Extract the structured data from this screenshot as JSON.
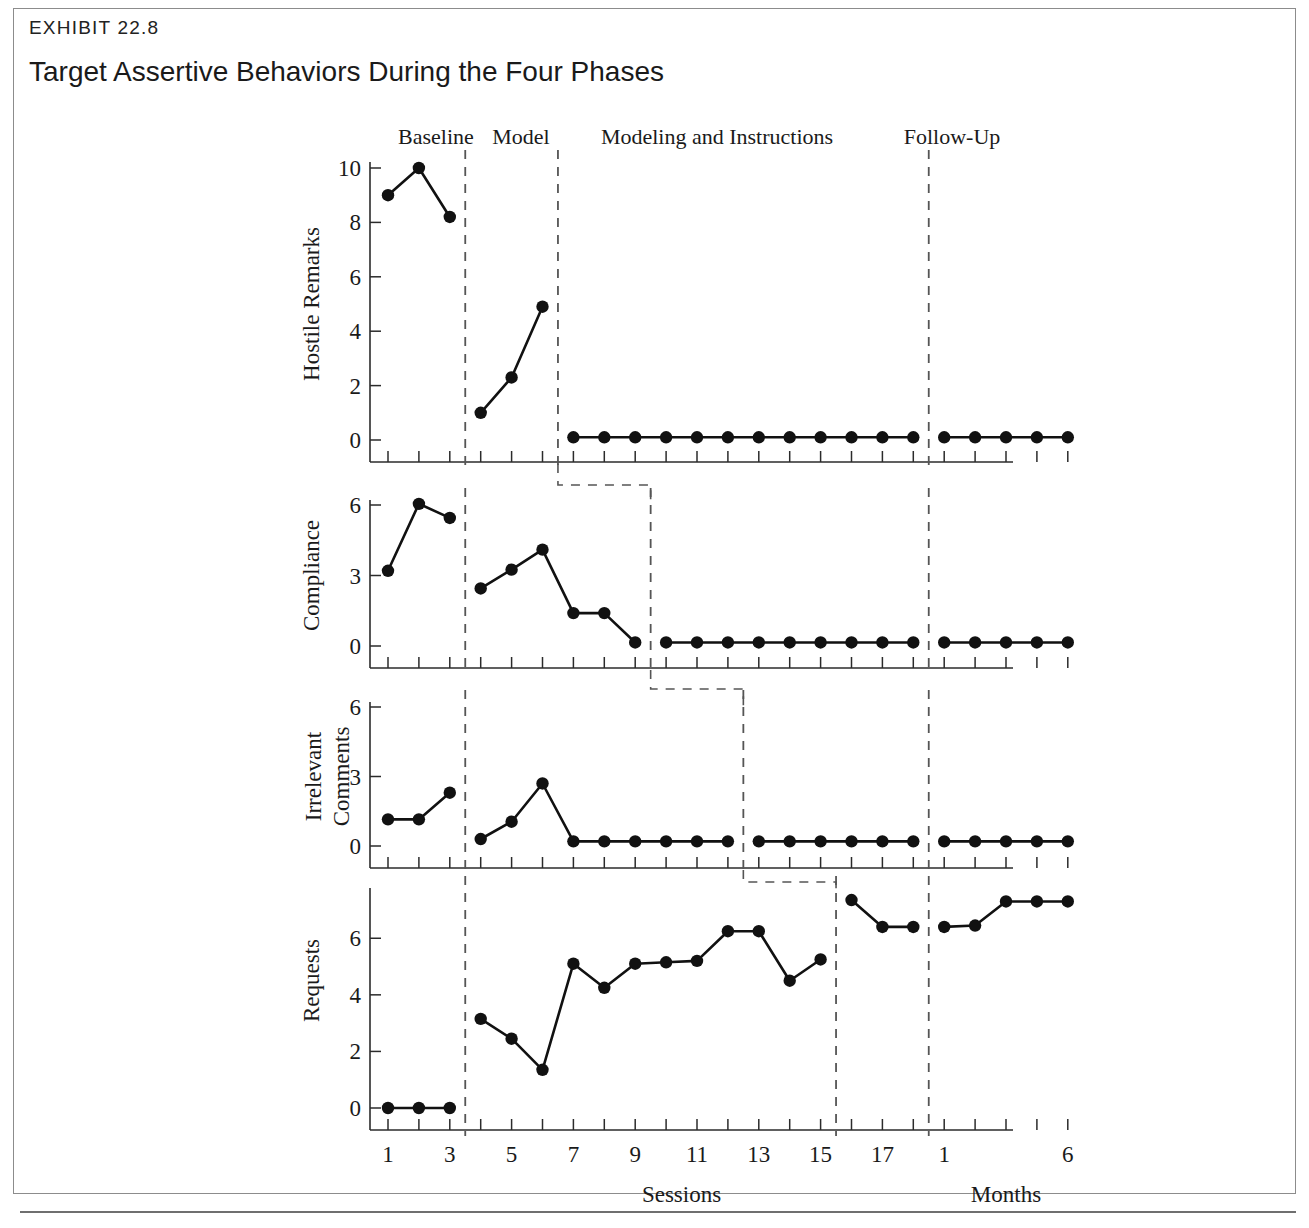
{
  "exhibit": {
    "kicker": "EXHIBIT 22.8",
    "title": "Target Assertive Behaviors During the Four Phases"
  },
  "chart_data": {
    "type": "line",
    "title": "Target Assertive Behaviors During the Four Phases",
    "xlabel": "Sessions",
    "xlabel_secondary": "Months",
    "grid": false,
    "legend": "none",
    "phases": [
      {
        "name": "Baseline",
        "sessions": [
          1,
          3
        ]
      },
      {
        "name": "Model",
        "sessions": [
          4,
          6
        ]
      },
      {
        "name": "Modeling and Instructions",
        "sessions": [
          7,
          18
        ]
      },
      {
        "name": "Follow-Up",
        "months": [
          1,
          6
        ]
      }
    ],
    "x_tick_labels_sessions": [
      "1",
      "3",
      "5",
      "7",
      "9",
      "11",
      "13",
      "15",
      "17"
    ],
    "x_tick_labels_months": [
      "1",
      "6"
    ],
    "panels": [
      {
        "ylabel": "Hostile Remarks",
        "ylim": [
          0,
          10
        ],
        "yticks": [
          0,
          2,
          4,
          6,
          8,
          10
        ],
        "segments": [
          {
            "phase": "Baseline",
            "x": [
              1,
              2,
              3
            ],
            "y": [
              9.0,
              10.0,
              8.2
            ]
          },
          {
            "phase": "Model",
            "x": [
              4,
              5,
              6
            ],
            "y": [
              1.0,
              2.3,
              4.9
            ]
          },
          {
            "phase": "Modeling and Instructions",
            "x": [
              7,
              8,
              9,
              10,
              11,
              12,
              13,
              14,
              15,
              16,
              17,
              18
            ],
            "y": [
              0.1,
              0.1,
              0.1,
              0.1,
              0.1,
              0.1,
              0.1,
              0.1,
              0.1,
              0.1,
              0.1,
              0.1
            ]
          },
          {
            "phase": "Follow-Up",
            "x": [
              19,
              20,
              21,
              22,
              23
            ],
            "y": [
              0.1,
              0.1,
              0.1,
              0.1,
              0.1
            ]
          }
        ],
        "phase_divider_sessions": [
          3.5,
          6.5,
          18.5
        ]
      },
      {
        "ylabel": "Compliance",
        "ylim": [
          0,
          6
        ],
        "yticks": [
          0,
          3,
          6
        ],
        "segments": [
          {
            "phase": "Baseline",
            "x": [
              1,
              2,
              3
            ],
            "y": [
              3.2,
              6.05,
              5.45
            ]
          },
          {
            "phase": "Model",
            "x": [
              4,
              5,
              6,
              7,
              8,
              9
            ],
            "y": [
              2.45,
              3.25,
              4.1,
              1.4,
              1.4,
              0.15
            ]
          },
          {
            "phase": "Modeling and Instructions",
            "x": [
              10,
              11,
              12,
              13,
              14,
              15,
              16,
              17,
              18
            ],
            "y": [
              0.15,
              0.15,
              0.15,
              0.15,
              0.15,
              0.15,
              0.15,
              0.15,
              0.15
            ]
          },
          {
            "phase": "Follow-Up",
            "x": [
              19,
              20,
              21,
              22,
              23
            ],
            "y": [
              0.15,
              0.15,
              0.15,
              0.15,
              0.15
            ]
          }
        ],
        "phase_divider_sessions": [
          3.5,
          9.5,
          18.5
        ]
      },
      {
        "ylabel": "Irrelevant\nComments",
        "ylabel_line1": "Irrelevant",
        "ylabel_line2": "Comments",
        "ylim": [
          0,
          6
        ],
        "yticks": [
          0,
          3,
          6
        ],
        "segments": [
          {
            "phase": "Baseline",
            "x": [
              1,
              2,
              3
            ],
            "y": [
              1.15,
              1.15,
              2.3
            ]
          },
          {
            "phase": "Model",
            "x": [
              4,
              5,
              6,
              7,
              8,
              9,
              10,
              11,
              12
            ],
            "y": [
              0.3,
              1.05,
              2.7,
              0.2,
              0.2,
              0.2,
              0.2,
              0.2,
              0.2
            ]
          },
          {
            "phase": "Modeling and Instructions",
            "x": [
              13,
              14,
              15,
              16,
              17,
              18
            ],
            "y": [
              0.2,
              0.2,
              0.2,
              0.2,
              0.2,
              0.2
            ]
          },
          {
            "phase": "Follow-Up",
            "x": [
              19,
              20,
              21,
              22,
              23
            ],
            "y": [
              0.2,
              0.2,
              0.2,
              0.2,
              0.2
            ]
          }
        ],
        "phase_divider_sessions": [
          3.5,
          12.5,
          18.5
        ]
      },
      {
        "ylabel": "Requests",
        "ylim": [
          0,
          7.6
        ],
        "yticks": [
          0,
          2,
          4,
          6
        ],
        "segments": [
          {
            "phase": "Baseline",
            "x": [
              1,
              2,
              3
            ],
            "y": [
              0.0,
              0.0,
              0.0
            ]
          },
          {
            "phase": "Model",
            "x": [
              4,
              5,
              6,
              7,
              8,
              9,
              10,
              11,
              12,
              13,
              14,
              15
            ],
            "y": [
              3.15,
              2.45,
              1.35,
              5.1,
              4.25,
              5.1,
              5.15,
              5.2,
              6.25,
              6.25,
              4.5,
              5.25
            ]
          },
          {
            "phase": "Modeling and Instructions",
            "x": [
              16,
              17,
              18
            ],
            "y": [
              7.35,
              6.4,
              6.4
            ]
          },
          {
            "phase": "Follow-Up",
            "x": [
              19,
              20,
              21,
              22,
              23
            ],
            "y": [
              6.4,
              6.45,
              7.3,
              7.3,
              7.3
            ]
          }
        ],
        "phase_divider_sessions": [
          3.5,
          15.5,
          18.5
        ]
      }
    ]
  }
}
